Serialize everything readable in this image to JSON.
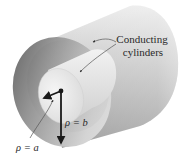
{
  "figure": {
    "labels": {
      "callout_line1": "Conducting",
      "callout_line2": "cylinders",
      "inner_radius": "ρ = a",
      "outer_radius": "ρ = b"
    },
    "colors": {
      "background": "#ffffff",
      "outer_body_light": "#e4e4e4",
      "outer_body_dark": "#a8a8a8",
      "outer_face_light": "#d0d0d0",
      "outer_face_dark": "#6e6e6e",
      "inner_face": "#ececec",
      "inner_body": "#dcdcdc",
      "arrow": "#1a1a1a",
      "leader_line": "#555555",
      "text": "#2a2a2a"
    }
  }
}
